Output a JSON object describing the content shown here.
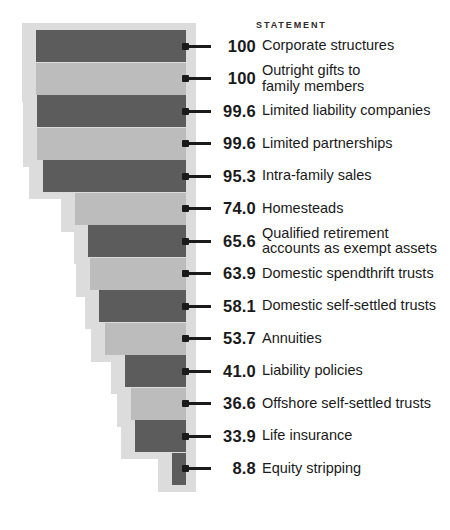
{
  "header": {
    "column_title": "STATEMENT"
  },
  "colors": {
    "bar_dark": "#5c5c5c",
    "bar_light": "#bcbcbc",
    "bar_shadow": "#dcdcdc",
    "text": "#1a1a1a",
    "background": "#ffffff"
  },
  "chart_data": {
    "type": "bar",
    "orientation": "horizontal",
    "title": "",
    "subtitle": "",
    "xlabel": "",
    "ylabel": "",
    "column_header": "STATEMENT",
    "grid": false,
    "legend": "none",
    "xlim": [
      0,
      100
    ],
    "value_suffix": "",
    "categories": [
      "Corporate structures",
      "Outright gifts to\nfamily members",
      "Limited liability companies",
      "Limited partnerships",
      "Intra-family sales",
      "Homesteads",
      "Qualified retirement\naccounts as exempt assets",
      "Domestic spendthrift trusts",
      "Domestic self-settled trusts",
      "Annuities",
      "Liability policies",
      "Offshore self-settled trusts",
      "Life insurance",
      "Equity stripping"
    ],
    "values": [
      100,
      100,
      99.6,
      99.6,
      95.3,
      74.0,
      65.6,
      63.9,
      58.1,
      53.7,
      41.0,
      36.6,
      33.9,
      8.8
    ],
    "value_labels": [
      "100",
      "100",
      "99.6",
      "99.6",
      "95.3",
      "74.0",
      "65.6",
      "63.9",
      "58.1",
      "53.7",
      "41.0",
      "36.6",
      "33.9",
      "8.8"
    ],
    "bar_shades": [
      "dark",
      "light",
      "dark",
      "light",
      "dark",
      "light",
      "dark",
      "light",
      "dark",
      "light",
      "dark",
      "light",
      "dark",
      "dark"
    ]
  }
}
